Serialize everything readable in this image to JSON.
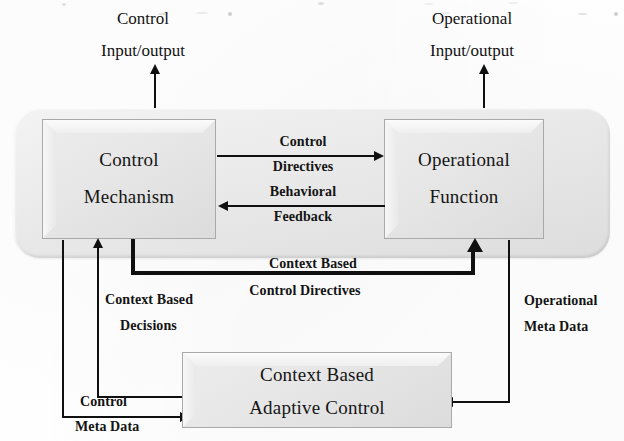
{
  "diagram": {
    "ink_color": "#101010",
    "box_fill": "#e6e6e6",
    "shell_fill": "#eaeaea",
    "nodes": {
      "control_mechanism": {
        "line1": "Control",
        "line2": "Mechanism"
      },
      "operational_function": {
        "line1": "Operational",
        "line2": "Function"
      },
      "adaptive_control": {
        "line1": "Context Based",
        "line2": "Adaptive Control"
      }
    },
    "external_io": {
      "control": {
        "line1": "Control",
        "line2": "Input/output"
      },
      "operational": {
        "line1": "Operational",
        "line2": "Input/output"
      }
    },
    "edges": {
      "control_directives": {
        "line1": "Control",
        "line2": "Directives"
      },
      "behavioral_feedback": {
        "line1": "Behavioral",
        "line2": "Feedback"
      },
      "context_based_control_directives": {
        "line1": "Context Based",
        "line2": "Control Directives"
      },
      "context_based_decisions": {
        "line1": "Context Based",
        "line2": "Decisions"
      },
      "control_meta_data": {
        "line1": "Control",
        "line2": "Meta Data"
      },
      "operational_meta_data": {
        "line1": "Operational",
        "line2": "Meta Data"
      }
    }
  }
}
